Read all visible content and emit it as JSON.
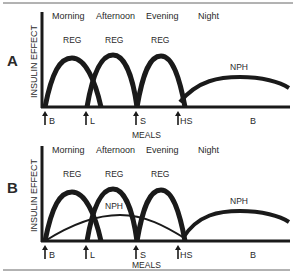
{
  "diagram": {
    "panels": [
      {
        "id": "A",
        "letter": "A",
        "y_label": "INSULIN EFFECT",
        "x_label": "MEALS",
        "periods": [
          "Morning",
          "Afternoon",
          "Evening",
          "Night"
        ],
        "curve_labels": [
          "REG",
          "REG",
          "REG",
          "NPH"
        ],
        "meals": [
          "B",
          "L",
          "S",
          "HS",
          "B"
        ]
      },
      {
        "id": "B",
        "letter": "B",
        "y_label": "INSULIN EFFECT",
        "x_label": "MEALS",
        "periods": [
          "Morning",
          "Afternoon",
          "Evening",
          "Night"
        ],
        "curve_labels": [
          "REG",
          "REG",
          "REG",
          "NPH",
          "NPH"
        ],
        "meals": [
          "B",
          "L",
          "S",
          "HS",
          "B"
        ]
      }
    ],
    "colors": {
      "ink": "#1a1a1a",
      "rule": "#555555",
      "background": "#ffffff"
    }
  }
}
